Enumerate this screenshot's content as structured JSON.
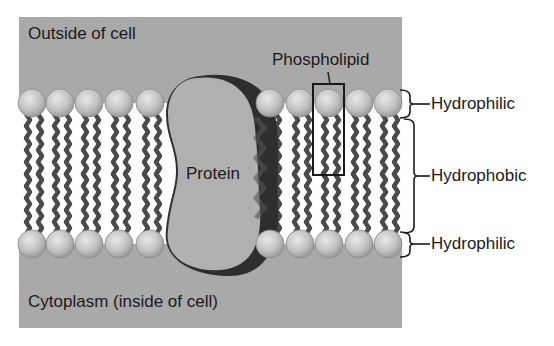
{
  "diagram": {
    "regions": {
      "outside": "Outside of cell",
      "inside": "Cytoplasm (inside of cell)"
    },
    "protein_label": "Protein",
    "phospholipid_label": "Phospholipid",
    "layers": [
      {
        "label": "Hydrophilic",
        "position": "top"
      },
      {
        "label": "Hydrophobic",
        "position": "middle"
      },
      {
        "label": "Hydrophilic",
        "position": "bottom"
      }
    ],
    "colors": {
      "background_panel": "#a9a9a9",
      "membrane_interior": "#ffffff",
      "tail": "#4a4a4a",
      "head_fill": "#c8c8c8",
      "protein_fill": "#b0b0b0",
      "protein_shadow": "#2e2e2e",
      "text": "#1a1a1a"
    }
  }
}
